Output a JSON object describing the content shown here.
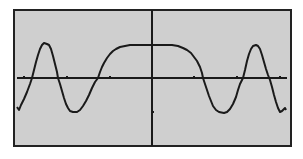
{
  "colors": {
    "screen_bg": "#cfcfcf",
    "frame": "#222222",
    "axis": "#1a1a1a",
    "curve": "#1a1a1a",
    "page_bg": "#ffffff"
  },
  "chart_data": {
    "type": "line",
    "title": "",
    "xlabel": "",
    "ylabel": "",
    "grid": false,
    "legend": null,
    "x_ticks_count_each_side": 3,
    "y_ticks_visible": [
      "-1"
    ],
    "approx_xlim": [
      -3.5,
      3.5
    ],
    "approx_ylim": [
      -2,
      2
    ],
    "series": [
      {
        "name": "f(x)",
        "points": [
          [
            -3.35,
            -0.88
          ],
          [
            -3.2,
            -0.6
          ],
          [
            -3.0,
            0.0
          ],
          [
            -2.8,
            0.85
          ],
          [
            -2.65,
            1.0
          ],
          [
            -2.5,
            0.8
          ],
          [
            -2.35,
            0.0
          ],
          [
            -2.15,
            -0.8
          ],
          [
            -2.0,
            -0.98
          ],
          [
            -1.85,
            -0.75
          ],
          [
            -1.65,
            0.0
          ],
          [
            -1.45,
            0.6
          ],
          [
            -1.2,
            0.9
          ],
          [
            -0.9,
            0.99
          ],
          [
            -0.5,
            1.0
          ],
          [
            0.0,
            1.0
          ],
          [
            0.5,
            1.0
          ],
          [
            0.9,
            0.99
          ],
          [
            1.2,
            0.9
          ],
          [
            1.45,
            0.6
          ],
          [
            1.65,
            0.0
          ],
          [
            1.85,
            -0.75
          ],
          [
            2.0,
            -0.98
          ],
          [
            2.15,
            -0.8
          ],
          [
            2.35,
            0.0
          ],
          [
            2.5,
            0.8
          ],
          [
            2.65,
            1.0
          ],
          [
            2.8,
            0.85
          ],
          [
            3.0,
            0.0
          ],
          [
            3.2,
            -0.6
          ],
          [
            3.35,
            -0.88
          ]
        ]
      }
    ]
  },
  "plot": {
    "frame": {
      "x": 14,
      "y": 10,
      "w": 277,
      "h": 136
    },
    "x_axis_y": 78,
    "y_axis_x": 152,
    "x_axis_range": [
      17,
      287
    ],
    "x_ticks_px": [
      24,
      67,
      110,
      194,
      237,
      280
    ],
    "y_ticks_px": [
      112
    ],
    "curve_px": [
      [
        17,
        107
      ],
      [
        19,
        110
      ],
      [
        21,
        105
      ],
      [
        24,
        99
      ],
      [
        27,
        92
      ],
      [
        30,
        84
      ],
      [
        32,
        78
      ],
      [
        34,
        70
      ],
      [
        36,
        62
      ],
      [
        38,
        55
      ],
      [
        40,
        49
      ],
      [
        42,
        45
      ],
      [
        44,
        43
      ],
      [
        47,
        44
      ],
      [
        49,
        45
      ],
      [
        51,
        49
      ],
      [
        53,
        56
      ],
      [
        55,
        64
      ],
      [
        57,
        72
      ],
      [
        58,
        78
      ],
      [
        60,
        84
      ],
      [
        62,
        91
      ],
      [
        64,
        98
      ],
      [
        66,
        104
      ],
      [
        68,
        108
      ],
      [
        70,
        111
      ],
      [
        73,
        112
      ],
      [
        77,
        112
      ],
      [
        80,
        110
      ],
      [
        83,
        106
      ],
      [
        86,
        101
      ],
      [
        89,
        95
      ],
      [
        92,
        88
      ],
      [
        95,
        82
      ],
      [
        98,
        78
      ],
      [
        100,
        72
      ],
      [
        102,
        67
      ],
      [
        104,
        63
      ],
      [
        107,
        58
      ],
      [
        110,
        54
      ],
      [
        113,
        51
      ],
      [
        116,
        49
      ],
      [
        120,
        47
      ],
      [
        125,
        46
      ],
      [
        130,
        45
      ],
      [
        136,
        45
      ],
      [
        145,
        45
      ],
      [
        152,
        45
      ],
      [
        160,
        45
      ],
      [
        167,
        45
      ],
      [
        172,
        45
      ],
      [
        178,
        46
      ],
      [
        183,
        48
      ],
      [
        187,
        50
      ],
      [
        191,
        53
      ],
      [
        194,
        57
      ],
      [
        197,
        61
      ],
      [
        200,
        67
      ],
      [
        202,
        73
      ],
      [
        203,
        78
      ],
      [
        205,
        84
      ],
      [
        207,
        90
      ],
      [
        209,
        96
      ],
      [
        211,
        101
      ],
      [
        213,
        106
      ],
      [
        216,
        110
      ],
      [
        219,
        112
      ],
      [
        224,
        113
      ],
      [
        227,
        112
      ],
      [
        230,
        109
      ],
      [
        233,
        104
      ],
      [
        236,
        97
      ],
      [
        238,
        90
      ],
      [
        240,
        84
      ],
      [
        243,
        78
      ],
      [
        245,
        70
      ],
      [
        247,
        61
      ],
      [
        249,
        54
      ],
      [
        251,
        49
      ],
      [
        253,
        46
      ],
      [
        256,
        45
      ],
      [
        258,
        46
      ],
      [
        260,
        49
      ],
      [
        262,
        55
      ],
      [
        264,
        62
      ],
      [
        266,
        69
      ],
      [
        268,
        75
      ],
      [
        270,
        80
      ],
      [
        272,
        87
      ],
      [
        274,
        95
      ],
      [
        276,
        102
      ],
      [
        278,
        108
      ],
      [
        280,
        112
      ],
      [
        282,
        111
      ],
      [
        285,
        108
      ],
      [
        286,
        110
      ]
    ]
  }
}
